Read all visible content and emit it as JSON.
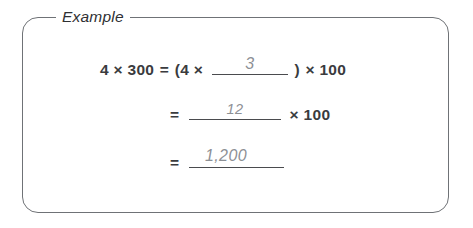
{
  "box": {
    "legend": "Example",
    "border_color": "#6f7276",
    "background": "#ffffff"
  },
  "colors": {
    "printed_text": "#3a3b3e",
    "handwritten_text": "#8d9095",
    "rule": "#4a4b4e"
  },
  "equations": [
    {
      "id": "line-1",
      "lhs": "4 × 300",
      "equals": "=",
      "open_paren": "(4 ×",
      "blank_answer": "3",
      "close_paren": ")",
      "tail": "× 100"
    },
    {
      "id": "line-2",
      "equals": "=",
      "blank_answer": "12",
      "tail": "× 100"
    },
    {
      "id": "line-3",
      "equals": "=",
      "blank_answer": "1,200"
    }
  ]
}
